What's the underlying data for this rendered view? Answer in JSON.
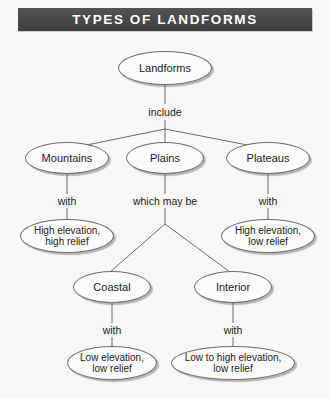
{
  "title": "TYPES OF LANDFORMS",
  "diagram": {
    "nodes": {
      "root": "Landforms",
      "mountains": "Mountains",
      "plains": "Plains",
      "plateaus": "Plateaus",
      "high_elev_high_relief": "High elevation,\nhigh relief",
      "high_elev_low_relief": "High elevation,\nlow relief",
      "coastal": "Coastal",
      "interior": "Interior",
      "low_elev_low_relief": "Low elevation,\nlow relief",
      "low_to_high_elev_low_relief": "Low to high elevation,\nlow relief"
    },
    "edge_labels": {
      "include": "include",
      "mountains_with": "with",
      "plains_which_may_be": "which may be",
      "plateaus_with": "with",
      "coastal_with": "with",
      "interior_with": "with"
    },
    "colors": {
      "title_band": "#4a4a4a",
      "title_text": "#ffffff",
      "node_outline": "#6f6f6f",
      "node_fill": "#fbfbfa",
      "connector": "#6a6a6a",
      "background": "#f7f7f5"
    }
  }
}
